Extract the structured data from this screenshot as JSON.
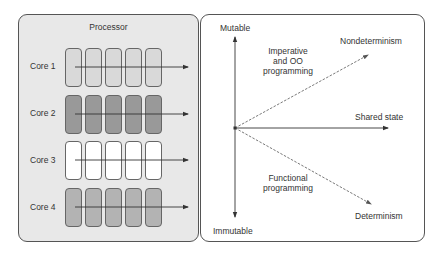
{
  "processor": {
    "title": "Processor",
    "cores": [
      {
        "label": "Core 1",
        "fill": "#d9d9d9",
        "cells": 5
      },
      {
        "label": "Core 2",
        "fill": "#999999",
        "cells": 5
      },
      {
        "label": "Core 3",
        "fill": "#ffffff",
        "cells": 5
      },
      {
        "label": "Core 4",
        "fill": "#b3b3b3",
        "cells": 5
      }
    ]
  },
  "quadrant": {
    "axis_top": "Mutable",
    "axis_bottom": "Immutable",
    "axis_right": "Shared state",
    "upper_arrow_label": "Nondeterminism",
    "lower_arrow_label": "Determinism",
    "upper_region_label": [
      "Imperative",
      "and OO",
      "programming"
    ],
    "lower_region_label": [
      "Functional",
      "programming"
    ]
  }
}
